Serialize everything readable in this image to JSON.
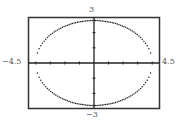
{
  "chart_data": {
    "type": "line",
    "title": "",
    "xlabel": "",
    "ylabel": "",
    "xlim": [
      -4.5,
      4.5
    ],
    "ylim": [
      -3,
      3
    ],
    "xscale": 1,
    "yscale": 1,
    "grid": false,
    "window_labels": {
      "xmin": "−4.5",
      "xmax": "4.5",
      "ymin": "−3",
      "ymax": "3"
    },
    "series": [
      {
        "name": "ellipse",
        "equation": "x^2/16 + y^2/9 = 1",
        "semi_axis_x": 4,
        "semi_axis_y": 2.8,
        "style": "dotted",
        "color": "#222222"
      }
    ]
  },
  "colors": {
    "frame": "#333333",
    "axes": "#222222",
    "curve": "#222222",
    "labels": "#555555"
  }
}
